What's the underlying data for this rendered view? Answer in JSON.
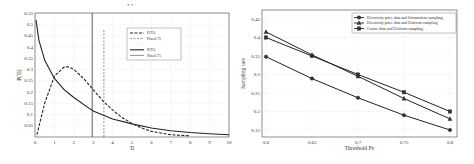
{
  "chart_data": [
    {
      "type": "line",
      "title": "",
      "xlabel": "Ti",
      "ylabel": "P(Ti)",
      "xlim": [
        0,
        10
      ],
      "ylim": [
        0,
        0.55
      ],
      "x_ticks": [
        "0",
        "1",
        "2",
        "3",
        "4",
        "5",
        "6",
        "7",
        "8",
        "9",
        "10"
      ],
      "y_ticks": [
        "0.05",
        "0.1",
        "0.15",
        "0.2",
        "0.25",
        "0.3",
        "0.35",
        "0.4",
        "0.45",
        "0.5",
        "0.55"
      ],
      "grid": true,
      "legend_position": "upper right",
      "legend": [
        "P(Ti)",
        "Pine0.75",
        "",
        "P(Ti)",
        "Pine0.75"
      ],
      "series": [
        {
          "name": "P(Ti) dashed",
          "style": "dashed",
          "x": [
            0.1,
            0.5,
            1,
            1.5,
            1.7,
            2,
            2.5,
            3,
            3.5,
            4,
            4.5,
            5,
            5.5,
            6,
            7,
            8
          ],
          "values": [
            0.01,
            0.15,
            0.27,
            0.31,
            0.312,
            0.3,
            0.26,
            0.21,
            0.16,
            0.12,
            0.085,
            0.06,
            0.04,
            0.025,
            0.01,
            0.005
          ]
        },
        {
          "name": "P(Ti) solid",
          "style": "solid",
          "x": [
            0.05,
            0.2,
            0.5,
            1,
            1.5,
            2,
            3,
            4,
            5,
            6,
            7,
            8,
            9,
            10
          ],
          "values": [
            0.52,
            0.43,
            0.34,
            0.26,
            0.21,
            0.175,
            0.115,
            0.08,
            0.058,
            0.04,
            0.028,
            0.02,
            0.014,
            0.01
          ]
        },
        {
          "name": "Pine0.75 dashed vertical",
          "style": "dashed",
          "x": [
            3.55,
            3.55
          ],
          "values": [
            0,
            0.475
          ]
        },
        {
          "name": "Pine0.75 solid vertical",
          "style": "solid",
          "x": [
            2.95,
            2.95
          ],
          "values": [
            0,
            0.55
          ]
        }
      ],
      "annotations": [
        "* *"
      ]
    },
    {
      "type": "line",
      "title": "",
      "xlabel": "Threshold Pv",
      "ylabel": "Sampling rate",
      "xlim": [
        0.6,
        0.8
      ],
      "ylim": [
        0.14,
        0.46
      ],
      "categories": [
        "0.6",
        "0.65",
        "0.7",
        "0.75",
        "0.8"
      ],
      "y_ticks": [
        "0.15",
        "0.2",
        "0.25",
        "0.3",
        "0.35",
        "0.4",
        "0.45"
      ],
      "grid": true,
      "legend_position": "upper right",
      "series": [
        {
          "name": "Electricity price data and Information sampling",
          "marker": "circle",
          "values": [
            0.348,
            0.289,
            0.237,
            0.19,
            0.15
          ]
        },
        {
          "name": "Electricity price data and Uniform sampling",
          "marker": "triangle",
          "values": [
            0.415,
            0.353,
            0.295,
            0.235,
            0.18
          ]
        },
        {
          "name": "Cosine data and Uniform sampling",
          "marker": "square",
          "values": [
            0.4,
            0.35,
            0.3,
            0.252,
            0.2
          ]
        }
      ]
    }
  ]
}
